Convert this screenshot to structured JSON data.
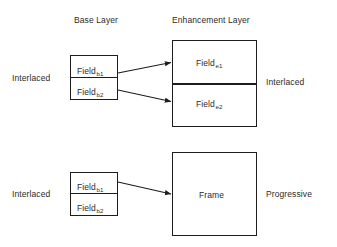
{
  "figure": {
    "background_color": "#ffffff",
    "line_color": "#1d1d1d",
    "text_color": "#2b2b2b"
  },
  "headers": {
    "base_layer": "Base Layer",
    "enhancement_layer": "Enhancement Layer"
  },
  "top_row": {
    "left_label": "Interlaced",
    "right_label": "Interlaced",
    "base": {
      "field1": "Field",
      "field1_sub": "b1",
      "field2": "Field",
      "field2_sub": "b2"
    },
    "enhancement": {
      "field1": "Field",
      "field1_sub": "e1",
      "field2": "Field",
      "field2_sub": "e2"
    }
  },
  "bottom_row": {
    "left_label": "Interlaced",
    "right_label": "Progressive",
    "base": {
      "field1": "Field",
      "field1_sub": "b1",
      "field2": "Field",
      "field2_sub": "b2"
    },
    "frame": {
      "label": "Frame"
    }
  }
}
